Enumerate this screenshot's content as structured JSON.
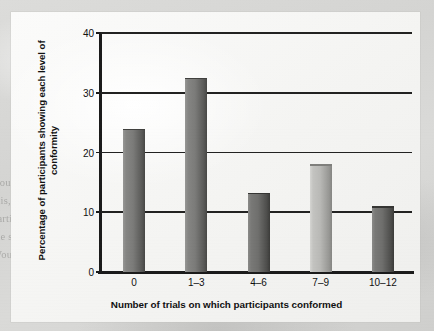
{
  "chart_data": {
    "type": "bar",
    "title": "",
    "categories": [
      "0",
      "1–3",
      "4–6",
      "7–9",
      "10–12"
    ],
    "values": [
      24,
      32.5,
      13.3,
      18,
      11
    ],
    "xlabel": "Number of trials on which participants conformed",
    "ylabel": "Percentage of participants showing each level of conformity",
    "ylim": [
      0,
      40
    ],
    "yticks": [
      0,
      10,
      20,
      30,
      40
    ],
    "ytick_labels": [
      "0",
      "10",
      "20",
      "30",
      "40"
    ],
    "grid": "horizontal",
    "legend": "none",
    "bar_colors": [
      "#7b7b79",
      "#7b7b79",
      "#6f6f6d",
      "#b9b9b6",
      "#6f6f6d"
    ]
  },
  "background": {
    "bleed_lines": [
      "Comparison line",
      "Standard line",
      "s, the",
      "would be simply for those observing the trials. Would the correct answer",
      "this, confederates placed on the opposite side but served in a position",
      "participants were a majority to conform the part of the pressures to make",
      "the second standard line—nearly half participants—down on Good ex",
      "Would be conform to the judgment of others, or would be stick with the"
    ]
  }
}
